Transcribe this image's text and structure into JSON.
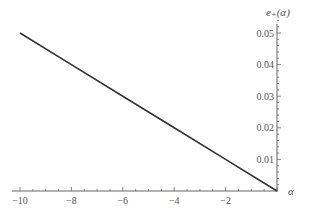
{
  "chart_data": {
    "type": "line",
    "title": "",
    "xlabel": "α",
    "ylabel": "e+(α)",
    "ylabel_display": "e₊(α)",
    "xlim": [
      -10,
      0
    ],
    "ylim": [
      0,
      0.05
    ],
    "x_ticks": [
      -10,
      -8,
      -6,
      -4,
      -2
    ],
    "x_tick_labels": [
      "−10",
      "−8",
      "−6",
      "−4",
      "−2"
    ],
    "y_ticks": [
      0.01,
      0.02,
      0.03,
      0.04,
      0.05
    ],
    "y_tick_labels": [
      "0.01",
      "0.02",
      "0.03",
      "0.04",
      "0.05"
    ],
    "grid": false,
    "legend": null,
    "series": [
      {
        "name": "e+(α)",
        "color": "#333333",
        "x": [
          -10,
          -8,
          -6,
          -4,
          -2,
          0
        ],
        "y": [
          0.05,
          0.04,
          0.03,
          0.02,
          0.01,
          0.0
        ]
      }
    ]
  }
}
